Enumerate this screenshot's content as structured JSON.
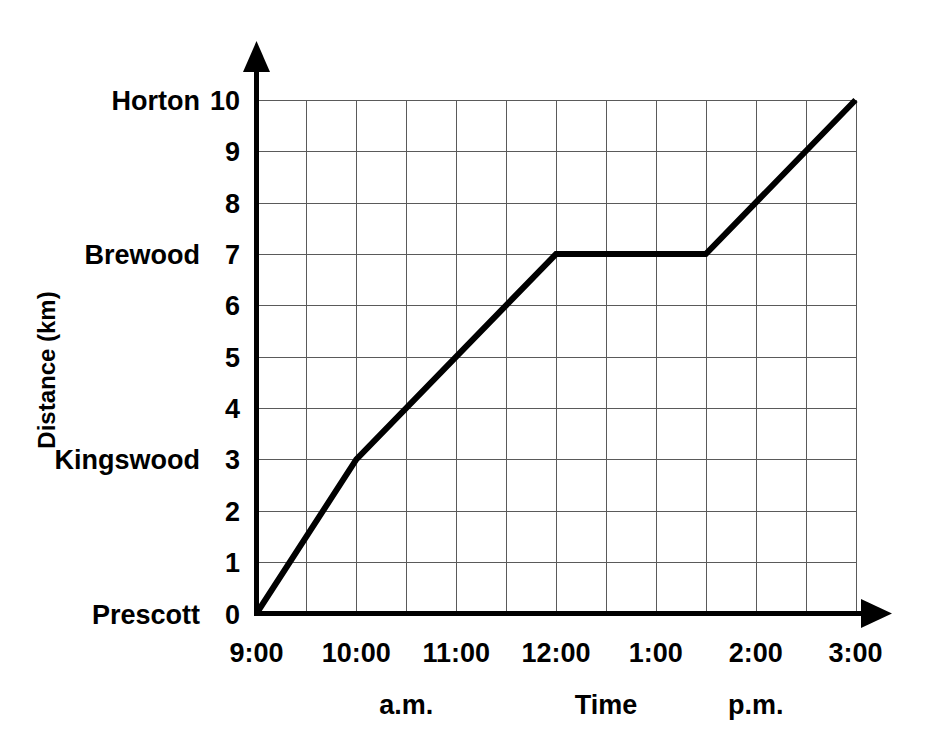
{
  "chart_data": {
    "type": "line",
    "title": "",
    "xlabel": "Time",
    "ylabel": "Distance (km)",
    "xlim": [
      9,
      15
    ],
    "ylim": [
      0,
      10
    ],
    "grid": true,
    "legend": "none",
    "x_tick_labels": [
      "9:00",
      "10:00",
      "11:00",
      "12:00",
      "1:00",
      "2:00",
      "3:00"
    ],
    "x_tick_values": [
      9,
      10,
      11,
      12,
      13,
      14,
      15
    ],
    "x_minor_step_hours": 0.5,
    "y_tick_labels": [
      "0",
      "1",
      "2",
      "3",
      "4",
      "5",
      "6",
      "7",
      "8",
      "9",
      "10"
    ],
    "y_tick_values": [
      0,
      1,
      2,
      3,
      4,
      5,
      6,
      7,
      8,
      9,
      10
    ],
    "period_labels": [
      {
        "text": "a.m.",
        "at_hour": 10.5
      },
      {
        "text": "Time",
        "at_hour": 12.5
      },
      {
        "text": "p.m.",
        "at_hour": 14.0
      }
    ],
    "place_labels": [
      {
        "name": "Horton",
        "km": 10
      },
      {
        "name": "Brewood",
        "km": 7
      },
      {
        "name": "Kingswood",
        "km": 3
      },
      {
        "name": "Prescott",
        "km": 0
      }
    ],
    "series": [
      {
        "name": "Journey",
        "color": "#000000",
        "points": [
          {
            "time": "9:00",
            "hour": 9,
            "km": 0
          },
          {
            "time": "10:00",
            "hour": 10,
            "km": 3
          },
          {
            "time": "12:00",
            "hour": 12,
            "km": 7
          },
          {
            "time": "1:30",
            "hour": 13.5,
            "km": 7
          },
          {
            "time": "3:00",
            "hour": 15,
            "km": 10
          }
        ]
      }
    ]
  },
  "colors": {
    "line": "#000000",
    "grid": "#5a5a5a",
    "axis": "#000000",
    "background": "#ffffff"
  }
}
